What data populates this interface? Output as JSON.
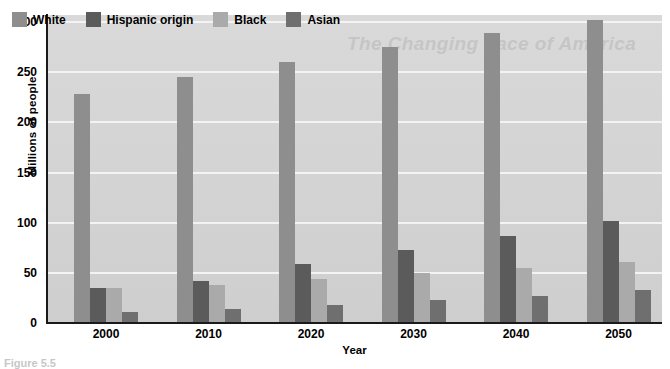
{
  "chart_data": {
    "type": "bar",
    "title": "",
    "xlabel": "Year",
    "ylabel": "Millions of people",
    "categories": [
      "2000",
      "2010",
      "2020",
      "2030",
      "2040",
      "2050"
    ],
    "ylim": [
      0,
      300
    ],
    "yticks": [
      0,
      50,
      100,
      150,
      200,
      250,
      300
    ],
    "ytick_labels": [
      "0",
      "50",
      "100",
      "150",
      "200",
      "250",
      "300"
    ],
    "grid": "horizontal",
    "legend_position": "top-left-inside",
    "series": [
      {
        "name": "White",
        "color": "#8e8e8e",
        "values": [
          228,
          245,
          260,
          275,
          289,
          302
        ]
      },
      {
        "name": "Hispanic origin",
        "color": "#5b5b5b",
        "values": [
          35,
          42,
          59,
          73,
          87,
          102
        ]
      },
      {
        "name": "Black",
        "color": "#aaaaaa",
        "values": [
          35,
          38,
          44,
          50,
          55,
          61
        ]
      },
      {
        "name": "Asian",
        "color": "#6f6f6f",
        "values": [
          11,
          14,
          18,
          23,
          27,
          33
        ]
      }
    ]
  },
  "legend": {
    "items": [
      {
        "label": "White",
        "color": "#8e8e8e"
      },
      {
        "label": "Hispanic origin",
        "color": "#5b5b5b"
      },
      {
        "label": "Black",
        "color": "#aaaaaa"
      },
      {
        "label": "Asian",
        "color": "#6f6f6f"
      }
    ]
  },
  "axes": {
    "y_title": "Millions of people",
    "x_title": "Year"
  },
  "watermark": {
    "text": "The Changing Face of America"
  },
  "caption": {
    "text": "Figure 5.5"
  },
  "colors": {
    "plot_background": "#d5d5d5",
    "gridline": "#f3f3f3",
    "axis": "#1a1a1a",
    "page_background": "#ffffff"
  }
}
